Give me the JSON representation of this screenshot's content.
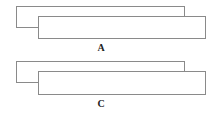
{
  "figures": [
    {
      "label": "A",
      "back_rect": {
        "x": 16,
        "y": 6,
        "w": 169,
        "h": 22
      },
      "front_rect": {
        "x": 38,
        "y": 16,
        "w": 168,
        "h": 23
      },
      "label_pos": {
        "x": 91,
        "y": 42
      }
    },
    {
      "label": "C",
      "back_rect": {
        "x": 16,
        "y": 61,
        "w": 169,
        "h": 22
      },
      "front_rect": {
        "x": 38,
        "y": 71,
        "w": 168,
        "h": 24
      },
      "label_pos": {
        "x": 91,
        "y": 98
      }
    }
  ],
  "colors": {
    "stroke": "#8a8a8a",
    "fill": "#ffffff",
    "text": "#222222"
  }
}
